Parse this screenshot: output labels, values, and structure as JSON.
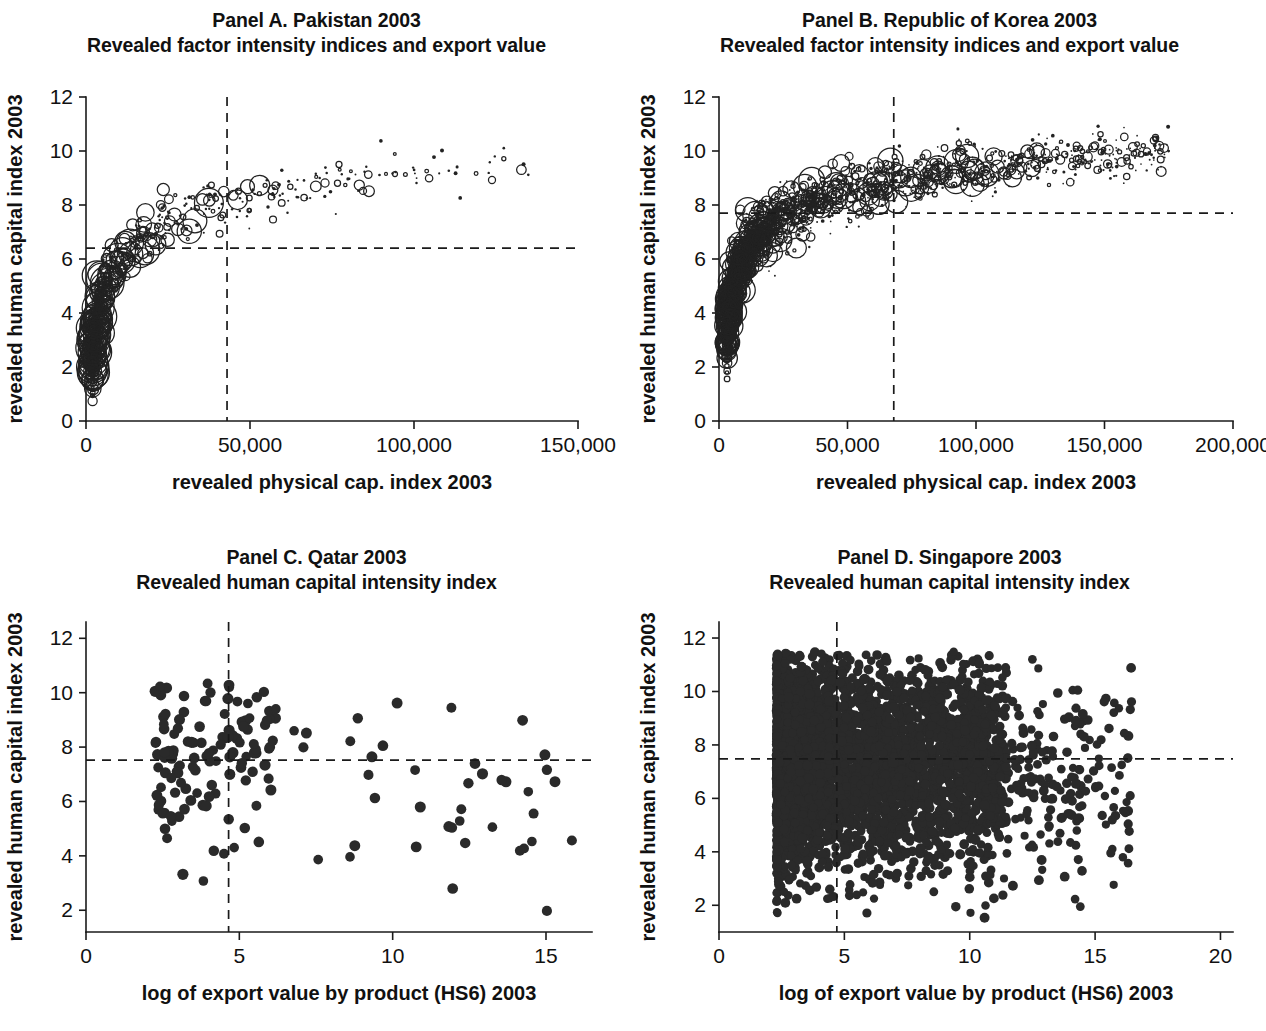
{
  "figure": {
    "width": 1266,
    "height": 1031,
    "background": "#ffffff",
    "ink_color": "#222222"
  },
  "chart_data": [
    {
      "id": "panel-a",
      "type": "scatter",
      "title": "Panel A. Pakistan 2003",
      "subtitle": "Revealed factor intensity indices and export value",
      "country": "Pakistan",
      "year": "2003",
      "marker_style": "open-circle-bubble",
      "marker_note": "Bubble size encodes export value by product (HS6)",
      "xlabel": "revealed physical cap. index 2003",
      "ylabel": "revealed human capital index 2003",
      "xlim": [
        0,
        150000
      ],
      "ylim": [
        0,
        12
      ],
      "xticks": [
        0,
        50000,
        100000,
        150000
      ],
      "xticklabels": [
        "0",
        "50,000",
        "100,000",
        "150,000"
      ],
      "yticks": [
        0,
        2,
        4,
        6,
        8,
        10,
        12
      ],
      "yticklabels": [
        "0",
        "2",
        "4",
        "6",
        "8",
        "10",
        "12"
      ],
      "grid": false,
      "legend": "none",
      "reference_lines": [
        {
          "orientation": "vertical",
          "value": 43000,
          "style": "dashed",
          "meaning": "country mean revealed physical capital index"
        },
        {
          "orientation": "horizontal",
          "value": 6.4,
          "style": "dashed",
          "meaning": "country mean revealed human capital index"
        }
      ],
      "n_points": 620,
      "cloud": {
        "shape": "upward concave log-curve",
        "x_min": 2000,
        "x_max": 135000,
        "y_at_xmin": 2.2,
        "y_at_xmax": 9.6,
        "curvature": 0.52,
        "y_scatter": 0.55,
        "density_skew": 2.6,
        "bubble_max_radius": 17,
        "bubble_min_radius": 1.2,
        "big_bubble_x_max": 55000
      }
    },
    {
      "id": "panel-b",
      "type": "scatter",
      "title": "Panel B. Republic of Korea 2003",
      "subtitle": "Revealed factor intensity indices and export value",
      "country": "Republic of Korea",
      "year": "2003",
      "marker_style": "open-circle-bubble",
      "marker_note": "Bubble size encodes export value by product (HS6)",
      "xlabel": "revealed physical cap. index 2003",
      "ylabel": "revealed human capital index 2003",
      "xlim": [
        0,
        200000
      ],
      "ylim": [
        0,
        12
      ],
      "xticks": [
        0,
        50000,
        100000,
        150000,
        200000
      ],
      "xticklabels": [
        "0",
        "50,000",
        "100,000",
        "150,000",
        "200,000"
      ],
      "yticks": [
        0,
        2,
        4,
        6,
        8,
        10,
        12
      ],
      "yticklabels": [
        "0",
        "2",
        "4",
        "6",
        "8",
        "10",
        "12"
      ],
      "grid": false,
      "legend": "none",
      "reference_lines": [
        {
          "orientation": "vertical",
          "value": 68000,
          "style": "dashed",
          "meaning": "country mean revealed physical capital index"
        },
        {
          "orientation": "horizontal",
          "value": 7.7,
          "style": "dashed",
          "meaning": "country mean revealed human capital index"
        }
      ],
      "n_points": 2100,
      "cloud": {
        "shape": "upward concave log-curve",
        "x_min": 3000,
        "x_max": 175000,
        "y_at_xmin": 3.0,
        "y_at_xmax": 10.0,
        "curvature": 0.62,
        "y_scatter": 0.62,
        "density_skew": 1.5,
        "bubble_max_radius": 13,
        "bubble_min_radius": 0.8,
        "big_bubble_x_max": 125000
      }
    },
    {
      "id": "panel-c",
      "type": "scatter",
      "title": "Panel C. Qatar 2003",
      "subtitle": "Revealed human capital intensity index",
      "country": "Qatar",
      "year": "2003",
      "marker_style": "filled-dot",
      "xlabel": "log of export value by product (HS6) 2003",
      "ylabel": "revealed human capital index 2003",
      "xlim": [
        0,
        16.5
      ],
      "ylim": [
        1.2,
        12.6
      ],
      "xticks": [
        0,
        5,
        10,
        15
      ],
      "xticklabels": [
        "0",
        "5",
        "10",
        "15"
      ],
      "yticks": [
        2,
        4,
        6,
        8,
        10,
        12
      ],
      "yticklabels": [
        "2",
        "4",
        "6",
        "8",
        "10",
        "12"
      ],
      "grid": false,
      "legend": "none",
      "reference_lines": [
        {
          "orientation": "vertical",
          "value": 4.65,
          "style": "dashed",
          "meaning": "mean log export value"
        },
        {
          "orientation": "horizontal",
          "value": 7.52,
          "style": "dashed",
          "meaning": "mean revealed human capital index"
        }
      ],
      "n_points": 175,
      "cloud": {
        "shape": "diffuse vertical band with long right tail",
        "x_core_min": 2.2,
        "x_core_max": 6.2,
        "x_tail_max": 16.0,
        "tail_fraction": 0.3,
        "y_center": 7.6,
        "y_spread": 1.7,
        "y_min": 1.6,
        "y_max": 10.4,
        "dot_radius": 5.2
      }
    },
    {
      "id": "panel-d",
      "type": "scatter",
      "title": "Panel D. Singapore 2003",
      "subtitle": "Revealed human capital intensity index",
      "country": "Singapore",
      "year": "2003",
      "marker_style": "filled-dot",
      "xlabel": "log of export value by product (HS6) 2003",
      "ylabel": "revealed human capital index 2003",
      "xlim": [
        0,
        20.5
      ],
      "ylim": [
        1.0,
        12.6
      ],
      "xticks": [
        0,
        5,
        10,
        15,
        20
      ],
      "xticklabels": [
        "0",
        "5",
        "10",
        "15",
        "20"
      ],
      "yticks": [
        2,
        4,
        6,
        8,
        10,
        12
      ],
      "yticklabels": [
        "2",
        "4",
        "6",
        "8",
        "10",
        "12"
      ],
      "grid": false,
      "legend": "none",
      "reference_lines": [
        {
          "orientation": "vertical",
          "value": 4.7,
          "style": "dashed",
          "meaning": "mean log export value"
        },
        {
          "orientation": "horizontal",
          "value": 7.48,
          "style": "dashed",
          "meaning": "mean revealed human capital index"
        }
      ],
      "n_points": 4200,
      "cloud": {
        "shape": "dense blob, right-skewed tail",
        "x_core_min": 2.3,
        "x_core_max": 11.5,
        "x_tail_max": 16.5,
        "y_center": 7.3,
        "y_spread": 1.95,
        "y_min": 1.4,
        "y_max": 11.5,
        "dot_radius": 4.6,
        "outliers": [
          {
            "x": 16.3,
            "y": 7.5
          },
          {
            "x": 16.4,
            "y": 6.1
          }
        ]
      }
    }
  ]
}
